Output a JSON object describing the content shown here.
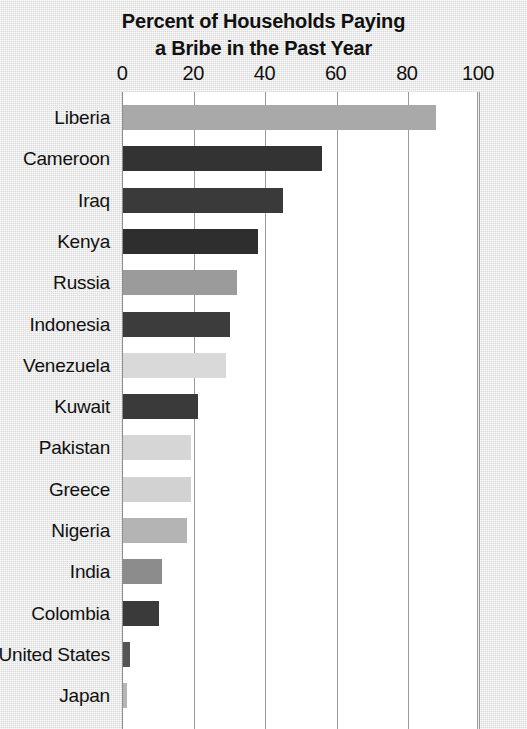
{
  "chart_data": {
    "type": "bar",
    "orientation": "horizontal",
    "title": "Percent of Households Paying a Bribe in the Past Year",
    "title_line1": "Percent of Households Paying",
    "title_line2": "a Bribe in the Past Year",
    "xlabel": "",
    "ylabel": "",
    "xlim": [
      0,
      100
    ],
    "xticks": [
      0,
      20,
      40,
      60,
      80,
      100
    ],
    "xtick_labels": [
      "0",
      "20",
      "40",
      "60",
      "80",
      "100"
    ],
    "grid": "vertical",
    "legend": "none",
    "categories": [
      "Liberia",
      "Cameroon",
      "Iraq",
      "Kenya",
      "Russia",
      "Indonesia",
      "Venezuela",
      "Kuwait",
      "Pakistan",
      "Greece",
      "Nigeria",
      "India",
      "Colombia",
      "United States",
      "Japan"
    ],
    "values": [
      88,
      56,
      45,
      38,
      32,
      30,
      29,
      21,
      19,
      19,
      18,
      11,
      10,
      2,
      1
    ],
    "bar_colors": [
      "#a9a9a9",
      "#333333",
      "#3a3a3a",
      "#2e2e2e",
      "#9b9b9b",
      "#3c3c3c",
      "#d9d9d9",
      "#3a3a3a",
      "#d6d6d6",
      "#d2d2d2",
      "#b4b4b4",
      "#8c8c8c",
      "#3a3a3a",
      "#555555",
      "#b5b5b5"
    ],
    "note": "Japan bar row is cropped at the bottom edge of the image"
  },
  "colors": {
    "background": "#e4e4e4",
    "plot_background": "#ffffff",
    "gridline": "#9a9a9a",
    "axis": "#8e8e8e",
    "text": "#111111"
  }
}
